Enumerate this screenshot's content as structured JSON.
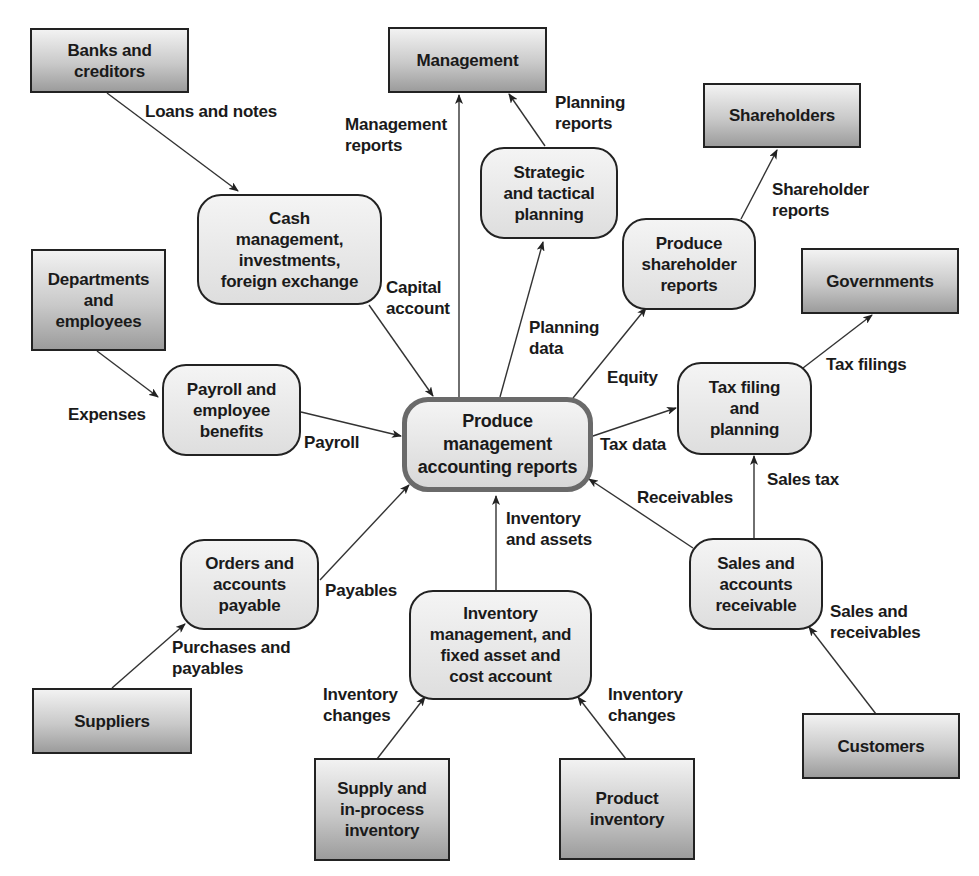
{
  "diagram": {
    "type": "data flow diagram",
    "center_process": "Produce\nmanagement\naccounting reports",
    "external_entities": {
      "banks": "Banks and\ncreditors",
      "management": "Management",
      "shareholders": "Shareholders",
      "departments": "Departments\nand\nemployees",
      "governments": "Governments",
      "suppliers": "Suppliers",
      "supply": "Supply and\nin-process\ninventory",
      "product": "Product\ninventory",
      "customers": "Customers"
    },
    "processes": {
      "cash": "Cash\nmanagement,\ninvestments,\nforeign exchange",
      "strategic": "Strategic\nand tactical\nplanning",
      "shareholder_reports": "Produce\nshareholder\nreports",
      "payroll": "Payroll and\nemployee\nbenefits",
      "tax": "Tax filing\nand\nplanning",
      "orders": "Orders and\naccounts\npayable",
      "inventory": "Inventory\nmanagement, and\nfixed asset and\ncost account",
      "sales": "Sales and\naccounts\nreceivable"
    },
    "flows": {
      "loans": "Loans and notes",
      "mgmt_reports": "Management\nreports",
      "planning_reports": "Planning\nreports",
      "shareholder_reports": "Shareholder\nreports",
      "capital": "Capital\naccount",
      "planning_data": "Planning\ndata",
      "equity": "Equity",
      "tax_filings": "Tax filings",
      "expenses": "Expenses",
      "payroll": "Payroll",
      "tax_data": "Tax data",
      "receivables": "Receivables",
      "sales_tax": "Sales tax",
      "inv_assets": "Inventory\nand assets",
      "payables": "Payables",
      "purchases": "Purchases and\npayables",
      "sales_recv": "Sales and\nreceivables",
      "inv_changes_left": "Inventory\nchanges",
      "inv_changes_right": "Inventory\nchanges"
    },
    "colors": {
      "line": "#333333",
      "center_border": "#6a6a6a",
      "ext_fill_top": "#f2f2f2",
      "ext_fill_bottom": "#9c9c9c",
      "proc_fill": "#e6e6e6"
    }
  }
}
